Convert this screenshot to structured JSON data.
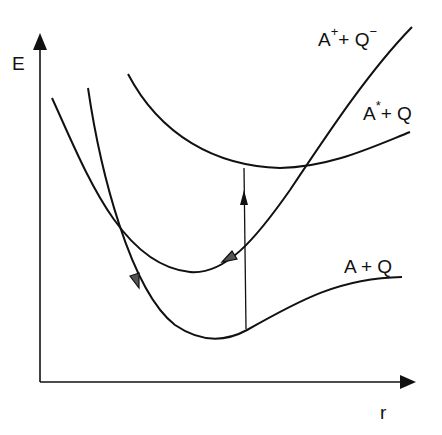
{
  "diagram": {
    "type": "potential-energy-curves",
    "axes": {
      "y_label": "E",
      "x_label": "r"
    },
    "curves": [
      {
        "name": "ionic",
        "label_base": "A",
        "label_sup": "+",
        "label_mid": "+ Q",
        "label_sup2": "−"
      },
      {
        "name": "excited",
        "label_base": "A",
        "label_sup": "*",
        "label_mid": "+ Q"
      },
      {
        "name": "ground",
        "label_base": "A + Q"
      }
    ],
    "transitions": [
      {
        "name": "vertical-excitation",
        "from": "A + Q",
        "to": "A* + Q",
        "direction": "up"
      },
      {
        "name": "decay-to-ionic",
        "along": "A+ + Q-",
        "direction": "down-left"
      },
      {
        "name": "decay-to-ground",
        "along": "A + Q",
        "direction": "down"
      }
    ],
    "colors": {
      "line": "#111111",
      "background": "#ffffff"
    }
  }
}
